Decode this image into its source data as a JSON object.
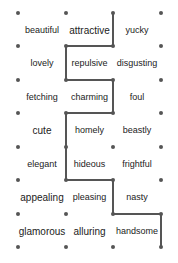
{
  "puzzle": {
    "grid": {
      "columns_x": [
        18,
        66,
        113,
        161
      ],
      "rows_y": [
        13,
        46,
        80,
        113,
        147,
        180,
        214,
        247
      ]
    },
    "path_color": "#555555",
    "path_points": [
      [
        113,
        13
      ],
      [
        113,
        46
      ],
      [
        66,
        46
      ],
      [
        66,
        80
      ],
      [
        113,
        80
      ],
      [
        113,
        113
      ],
      [
        66,
        113
      ],
      [
        66,
        180
      ],
      [
        113,
        180
      ],
      [
        113,
        214
      ],
      [
        161,
        214
      ],
      [
        161,
        247
      ]
    ],
    "words": [
      {
        "text": "beautiful",
        "row": 0,
        "col": 0,
        "size": 9
      },
      {
        "text": "attractive",
        "row": 0,
        "col": 1,
        "size": 10
      },
      {
        "text": "yucky",
        "row": 0,
        "col": 2,
        "size": 9
      },
      {
        "text": "lovely",
        "row": 1,
        "col": 0,
        "size": 9
      },
      {
        "text": "repulsive",
        "row": 1,
        "col": 1,
        "size": 9
      },
      {
        "text": "disgusting",
        "row": 1,
        "col": 2,
        "size": 9
      },
      {
        "text": "fetching",
        "row": 2,
        "col": 0,
        "size": 9
      },
      {
        "text": "charming",
        "row": 2,
        "col": 1,
        "size": 9
      },
      {
        "text": "foul",
        "row": 2,
        "col": 2,
        "size": 9
      },
      {
        "text": "cute",
        "row": 3,
        "col": 0,
        "size": 10
      },
      {
        "text": "homely",
        "row": 3,
        "col": 1,
        "size": 9
      },
      {
        "text": "beastly",
        "row": 3,
        "col": 2,
        "size": 9
      },
      {
        "text": "elegant",
        "row": 4,
        "col": 0,
        "size": 9
      },
      {
        "text": "hideous",
        "row": 4,
        "col": 1,
        "size": 9
      },
      {
        "text": "frightful",
        "row": 4,
        "col": 2,
        "size": 9
      },
      {
        "text": "appealing",
        "row": 5,
        "col": 0,
        "size": 10
      },
      {
        "text": "pleasing",
        "row": 5,
        "col": 1,
        "size": 9
      },
      {
        "text": "nasty",
        "row": 5,
        "col": 2,
        "size": 9
      },
      {
        "text": "glamorous",
        "row": 6,
        "col": 0,
        "size": 10
      },
      {
        "text": "alluring",
        "row": 6,
        "col": 1,
        "size": 10
      },
      {
        "text": "handsome",
        "row": 6,
        "col": 2,
        "size": 9
      }
    ]
  }
}
